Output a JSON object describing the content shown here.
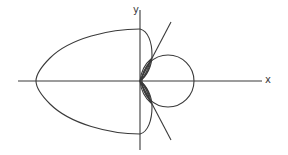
{
  "diagram": {
    "type": "polar-curve-plot",
    "axes": {
      "x_label": "x",
      "y_label": "y"
    },
    "elements": [
      {
        "name": "outer-loop",
        "description": "large egg-shaped loop extending into negative x"
      },
      {
        "name": "right-circle",
        "description": "circle-like loop on positive x side"
      },
      {
        "name": "inner-leaves",
        "description": "small nested leaf loops near origin"
      },
      {
        "name": "tangent-lines",
        "description": "two straight lines through origin, symmetric about x-axis"
      }
    ],
    "colors": {
      "stroke": "#3a3a3a",
      "background": "#ffffff"
    }
  }
}
